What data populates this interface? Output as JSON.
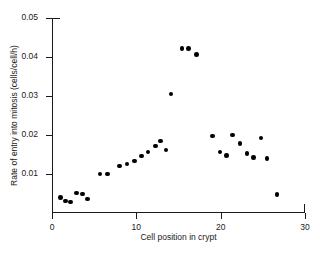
{
  "chart_data": {
    "type": "scatter",
    "title": "",
    "xlabel": "Cell position in crypt",
    "ylabel": "Rate of entry into mitosis (cells/cell/h)",
    "xlim": [
      0,
      30
    ],
    "ylim": [
      0,
      0.05
    ],
    "xticks": [
      0,
      10,
      20,
      30
    ],
    "xtick_labels": [
      "0",
      "10",
      "20",
      "30"
    ],
    "yticks": [
      0.01,
      0.02,
      0.03,
      0.04,
      0.05
    ],
    "ytick_labels": [
      "0.01",
      "0.02",
      "0.03",
      "0.04",
      "0.05"
    ],
    "grid": false,
    "legend": false,
    "marker": "filled-circle",
    "marker_color": "#000000",
    "points": [
      {
        "x": 1.0,
        "y": 0.004
      },
      {
        "x": 1.6,
        "y": 0.0031
      },
      {
        "x": 2.2,
        "y": 0.0028
      },
      {
        "x": 2.9,
        "y": 0.0051
      },
      {
        "x": 3.6,
        "y": 0.0049
      },
      {
        "x": 4.2,
        "y": 0.0036
      },
      {
        "x": 5.7,
        "y": 0.01
      },
      {
        "x": 6.6,
        "y": 0.01
      },
      {
        "x": 8.0,
        "y": 0.012
      },
      {
        "x": 8.9,
        "y": 0.0126
      },
      {
        "x": 9.8,
        "y": 0.0133
      },
      {
        "x": 10.6,
        "y": 0.0146
      },
      {
        "x": 11.4,
        "y": 0.0156
      },
      {
        "x": 12.3,
        "y": 0.0172
      },
      {
        "x": 12.9,
        "y": 0.0185
      },
      {
        "x": 13.5,
        "y": 0.0162
      },
      {
        "x": 14.1,
        "y": 0.0305
      },
      {
        "x": 15.4,
        "y": 0.0422
      },
      {
        "x": 16.2,
        "y": 0.0422
      },
      {
        "x": 17.1,
        "y": 0.0406
      },
      {
        "x": 19.0,
        "y": 0.0197
      },
      {
        "x": 19.9,
        "y": 0.0156
      },
      {
        "x": 20.7,
        "y": 0.0148
      },
      {
        "x": 21.4,
        "y": 0.02
      },
      {
        "x": 22.3,
        "y": 0.0178
      },
      {
        "x": 23.1,
        "y": 0.0152
      },
      {
        "x": 23.9,
        "y": 0.0143
      },
      {
        "x": 24.8,
        "y": 0.0192
      },
      {
        "x": 25.5,
        "y": 0.014
      },
      {
        "x": 26.7,
        "y": 0.0047
      }
    ]
  }
}
